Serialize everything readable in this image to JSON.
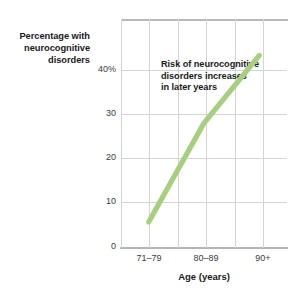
{
  "chart_data": {
    "type": "line",
    "title": "",
    "subtitle": "",
    "xlabel": "Age (years)",
    "ylabel": "Percentage with neurocognitive disorders",
    "ylabel_lines": [
      "Percentage with",
      "neurocognitive",
      "disorders"
    ],
    "categories": [
      "71–79",
      "80–89",
      "90+"
    ],
    "values": [
      5,
      24,
      37
    ],
    "series": [
      {
        "name": "Percentage with neurocognitive disorders",
        "values": [
          5,
          24,
          37
        ],
        "color": "#a8cf7f"
      }
    ],
    "ylim": [
      0,
      44
    ],
    "xlim": [
      0,
      6
    ],
    "y_ticks": [
      0,
      10,
      20,
      30,
      40
    ],
    "y_tick_labels": [
      "0",
      "10",
      "20",
      "30",
      "40%"
    ],
    "x_tick_labels": [
      "71–79",
      "80–89",
      "90+"
    ],
    "grid": "both",
    "legend": "none",
    "annotations": [
      {
        "text": "Risk of neurocognitive disorders increases in later years",
        "lines": [
          "Risk of neurocognitive",
          "disorders increases",
          "in later years"
        ]
      }
    ],
    "colors": {
      "line": "#a8cf7f",
      "grid": "#d4d4d4",
      "axis": "#b4b4b4",
      "text": "#1a1a1a",
      "tick_text": "#3b3b3b",
      "background": "#ffffff"
    }
  }
}
